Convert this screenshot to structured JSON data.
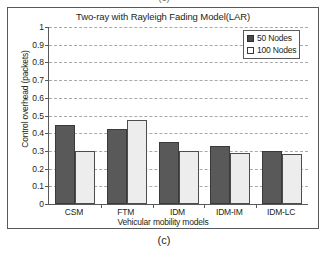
{
  "figure": {
    "top_caption": "(c)",
    "bottom_caption": "(c)"
  },
  "chart_data": {
    "type": "bar",
    "title": "Two-ray with Rayleigh Fading Model(LAR)",
    "xlabel": "Vehicular mobility models",
    "ylabel": "Control overhead (packets)",
    "categories": [
      "CSM",
      "FTM",
      "IDM",
      "IDM-IM",
      "IDM-LC"
    ],
    "series": [
      {
        "name": "50 Nodes",
        "values": [
          0.445,
          0.425,
          0.35,
          0.325,
          0.3
        ],
        "color": "#595959"
      },
      {
        "name": "100 Nodes",
        "values": [
          0.3,
          0.475,
          0.3,
          0.29,
          0.28
        ],
        "color": "#ededed"
      }
    ],
    "ylim": [
      0,
      1
    ],
    "ytick_labels": [
      "1",
      "0.9",
      "0.8",
      "0.7",
      "0.6",
      "0.5",
      "0.4",
      "0.3",
      "0.2",
      "0.1",
      "0"
    ],
    "ytick_values": [
      1,
      0.9,
      0.8,
      0.7,
      0.6,
      0.5,
      0.4,
      0.3,
      0.2,
      0.1,
      0
    ],
    "grid": true,
    "legend_position": "top-right"
  }
}
